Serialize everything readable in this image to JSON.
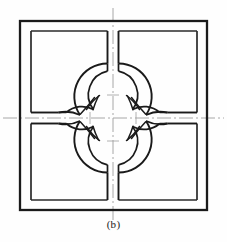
{
  "figure": {
    "caption": "(b)",
    "type": "engineering-drawing",
    "background_color": "#fefefe",
    "line_color": "#1a1a1a",
    "centerline_color": "#9a9a9a",
    "outer_square": {
      "name": "outer-boundary-square",
      "x": 20,
      "y": 21,
      "width": 187,
      "height": 189,
      "stroke_width": 2.2
    },
    "inner_square": {
      "name": "inner-cavity-square",
      "x": 31,
      "y": 31,
      "width": 166,
      "height": 169,
      "stroke_width": 1.6
    },
    "center": {
      "x": 113,
      "y": 118
    },
    "quatrefoil": {
      "name": "quatrefoil-cavity",
      "lobe_offset": 23,
      "outer_lobe_radius": 33,
      "inner_lobe_radius": 24,
      "lobe_centers": [
        {
          "label": "top",
          "x": 113,
          "y": 95
        },
        {
          "label": "right",
          "x": 136,
          "y": 118
        },
        {
          "label": "bottom",
          "x": 113,
          "y": 141
        },
        {
          "label": "left",
          "x": 90,
          "y": 118
        }
      ]
    },
    "channels": [
      {
        "name": "channel-top",
        "direction": "up",
        "half_width": 5.5
      },
      {
        "name": "channel-right",
        "direction": "right",
        "half_width": 5.5
      },
      {
        "name": "channel-bottom",
        "direction": "down",
        "half_width": 5.5
      },
      {
        "name": "channel-left",
        "direction": "left",
        "half_width": 5.5
      }
    ],
    "centerlines": {
      "vertical": {
        "x": 113,
        "y1": 8,
        "y2": 228
      },
      "horizontal": {
        "y": 118,
        "x1": 3,
        "x2": 224
      },
      "dash_pattern": "14 3 2 3"
    },
    "fillet_marks": {
      "name": "junction-fillet-marks",
      "count": 4,
      "description": "small hand-drawn arc fillets at each lobe-to-lobe junction"
    }
  }
}
